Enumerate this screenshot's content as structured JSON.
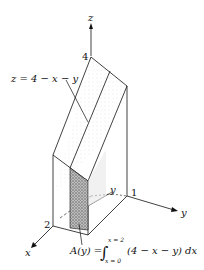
{
  "diagram": {
    "axes": {
      "x_label": "x",
      "y_label": "y",
      "z_label": "z"
    },
    "ticks": {
      "z_tick": "4",
      "x_tick": "2",
      "y_tick": "1"
    },
    "surface_label": "z = 4 − x − y",
    "slice_y_label": "y",
    "formula": {
      "lhs": "A(y) =",
      "upper_limit": "x = 2",
      "lower_limit": "x = 0",
      "integrand": "(4 − x − y) dx"
    },
    "colors": {
      "ink": "#111111",
      "slice_shade": "#8a8a8a",
      "background": "#ffffff"
    }
  }
}
